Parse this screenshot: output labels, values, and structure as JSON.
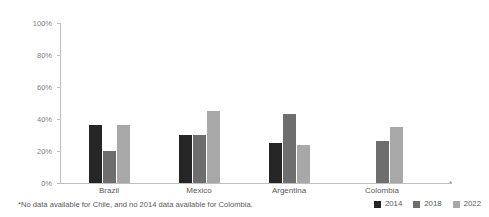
{
  "chart_data": {
    "type": "bar",
    "title": "",
    "subtitle": "",
    "xlabel": "",
    "ylabel": "Percentage of general population",
    "ylim": [
      0,
      100
    ],
    "y_ticks": [
      "0%",
      "20%",
      "40%",
      "60%",
      "80%",
      "100%"
    ],
    "y_tick_values": [
      0,
      20,
      40,
      60,
      80,
      100
    ],
    "grid": false,
    "legend_position": "bottom-right",
    "categories": [
      "Brazil",
      "Mexico",
      "Argentina",
      "Colombia"
    ],
    "series": [
      {
        "name": "2014",
        "color": "#262626",
        "values": [
          36,
          30,
          25,
          null
        ]
      },
      {
        "name": "2018",
        "color": "#6e6e6e",
        "values": [
          20,
          30,
          43,
          26
        ]
      },
      {
        "name": "2022",
        "color": "#a8a8a8",
        "values": [
          36,
          45,
          24,
          35
        ]
      }
    ],
    "annotations": {
      "axis_marker": "*",
      "footnote": "*No data available for Chile, and no 2014 data available for Colombia."
    }
  },
  "axis": {
    "tick_0": "0%",
    "tick_20": "20%",
    "tick_40": "40%",
    "tick_60": "60%",
    "tick_80": "80%",
    "tick_100": "100%",
    "y_title": "Percentage of general population"
  },
  "categories": {
    "c0": "Brazil",
    "c1": "Mexico",
    "c2": "Argentina",
    "c3": "Colombia"
  },
  "legend": {
    "items": [
      {
        "label": "2014"
      },
      {
        "label": "2018"
      },
      {
        "label": "2022"
      }
    ]
  },
  "footnote": {
    "text": "*No data available for Chile, and no 2014 data available for Colombia."
  },
  "marker": {
    "asterisk": "*"
  },
  "colors": {
    "series_2014": "#262626",
    "series_2018": "#6e6e6e",
    "series_2022": "#a8a8a8",
    "axis": "#bfbfbf",
    "text": "#595959"
  }
}
